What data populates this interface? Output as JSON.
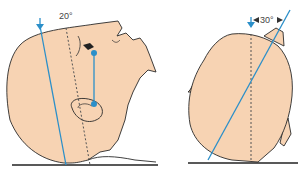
{
  "figure": {
    "left_panel": {
      "view": "lateral",
      "angle_label": "20°",
      "angle_degrees": 20
    },
    "right_panel": {
      "view": "axial",
      "angle_label": "30°",
      "angle_degrees": 30
    }
  },
  "colors": {
    "skin": "#f7d3b3",
    "outline": "#2a2a2a",
    "beam": "#2b8fc9",
    "dashed_line": "#555555",
    "ground": "#222222"
  }
}
